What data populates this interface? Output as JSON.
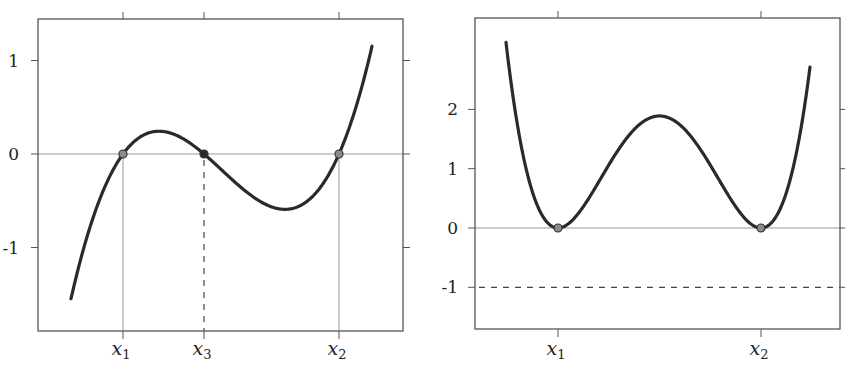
{
  "chart_data": [
    {
      "type": "line",
      "title": "",
      "xlabel": "",
      "ylabel": "",
      "function": "cubic with three real roots x1 < x3 < x2",
      "xtick_labels": [
        {
          "label": "x",
          "sub": "1",
          "name": "x1"
        },
        {
          "label": "x",
          "sub": "3",
          "name": "x3"
        },
        {
          "label": "x",
          "sub": "2",
          "name": "x2"
        }
      ],
      "yticks": [
        1,
        0,
        -1
      ],
      "ytick_labels": [
        "1",
        "0",
        "-1"
      ],
      "ylim": [
        -1.9,
        1.45
      ],
      "roots": {
        "x1": 0,
        "x3": 0.87,
        "x2": 2.31
      },
      "local_max": {
        "x": 0.4,
        "y": 0.24
      },
      "local_min": {
        "x": 1.75,
        "y": -0.59
      },
      "curve_range": {
        "x_start": -0.56,
        "y_start": -1.59,
        "x_end": 2.66,
        "y_end": 1.17
      },
      "marked_points": [
        {
          "name": "x1",
          "x": 0,
          "y": 0,
          "fill": "#8c8c8c"
        },
        {
          "name": "x3",
          "x": 0.87,
          "y": 0,
          "fill": "#2a2a2a"
        },
        {
          "name": "x2",
          "x": 2.31,
          "y": 0,
          "fill": "#8c8c8c"
        }
      ],
      "reference_lines": [
        {
          "type": "horizontal",
          "y": 0,
          "style": "solid-gray"
        },
        {
          "type": "vertical",
          "x": "x1",
          "style": "solid-gray"
        },
        {
          "type": "vertical",
          "x": "x2",
          "style": "solid-gray"
        },
        {
          "type": "vertical",
          "x": "x3",
          "style": "dashed"
        }
      ],
      "grid": false,
      "legend": null
    },
    {
      "type": "line",
      "title": "",
      "xlabel": "",
      "ylabel": "",
      "function": "quartic double-well with double roots at x1 and x2",
      "xtick_labels": [
        {
          "label": "x",
          "sub": "1",
          "name": "x1"
        },
        {
          "label": "x",
          "sub": "2",
          "name": "x2"
        }
      ],
      "yticks": [
        2,
        1,
        0,
        -1
      ],
      "ytick_labels": [
        "2",
        "1",
        "0",
        "-1"
      ],
      "ylim": [
        -1.7,
        3.55
      ],
      "minima": [
        {
          "name": "x1",
          "x": 0,
          "y": 0
        },
        {
          "name": "x2",
          "x": 2,
          "y": 0
        }
      ],
      "local_max": {
        "x": 1.0,
        "y": 1.89
      },
      "curve_range": {
        "x_start": -0.26,
        "y_start": 3.09,
        "x_end": 2.47,
        "y_end": 2.51
      },
      "marked_points": [
        {
          "name": "x1",
          "x": 0,
          "y": 0,
          "fill": "#8c8c8c"
        },
        {
          "name": "x2",
          "x": 2,
          "y": 0,
          "fill": "#8c8c8c"
        }
      ],
      "reference_lines": [
        {
          "type": "horizontal",
          "y": 0,
          "style": "solid-gray"
        },
        {
          "type": "horizontal",
          "y": -1,
          "style": "dashed"
        }
      ],
      "grid": false,
      "legend": null
    }
  ],
  "layout": {
    "left": {
      "frame": [
        38,
        19,
        403,
        331
      ],
      "px": {
        "x1": 123,
        "x3": 204,
        "x2": 339,
        "y0": 154,
        "unit_y": 93.5,
        "curve_x": [
          71,
          372
        ],
        "coef": 8.35e-07
      }
    },
    "right": {
      "frame": [
        475,
        18,
        840,
        329
      ],
      "px": {
        "x1": 558,
        "x2": 761,
        "y0": 228,
        "unit_y": 59.3,
        "curve_x": [
          506,
          810
        ],
        "coef": 1.78e-08
      }
    },
    "colors": {
      "curve": "#2a2a2a",
      "axis": "#555555",
      "refline": "#9a9a9a",
      "point_fill": "#8c8c8c",
      "point_fill_dark": "#2a2a2a"
    }
  }
}
